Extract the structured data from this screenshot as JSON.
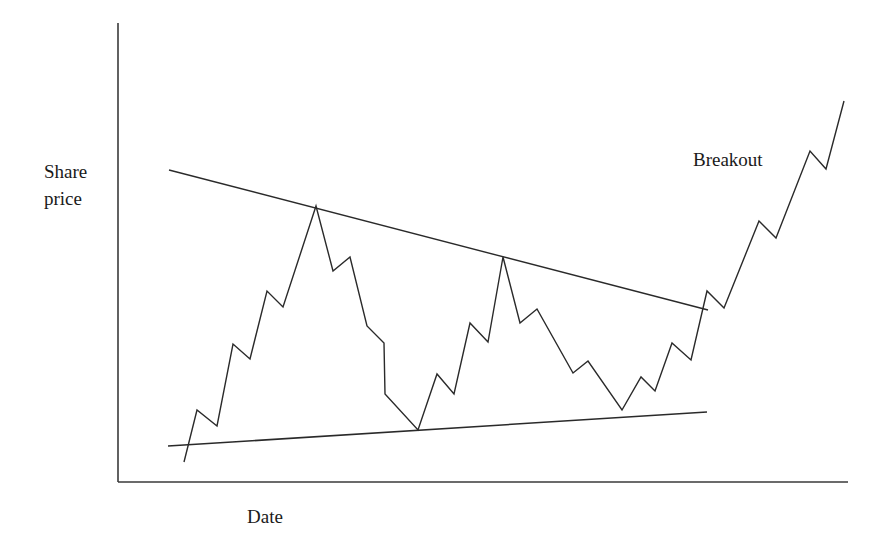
{
  "chart_data": {
    "type": "line",
    "title": "",
    "xlabel": "Date",
    "ylabel": "Share price",
    "ylabel_lines": [
      "Share",
      "price"
    ],
    "grid": false,
    "legend": null,
    "ticks": {
      "x": [],
      "y": []
    },
    "annotations": [
      {
        "text": "Breakout",
        "x_px": 693,
        "y_px": 160
      }
    ],
    "colors": {
      "line": "#2a2a2a",
      "axis": "#3a3a3a",
      "background": "#ffffff"
    },
    "axes_px": {
      "origin": [
        118,
        482
      ],
      "y_top": [
        118,
        23
      ],
      "x_end": [
        848,
        482
      ]
    },
    "series": [
      {
        "name": "Share price",
        "kind": "price",
        "points_px": [
          [
            184,
            462
          ],
          [
            197,
            410
          ],
          [
            217,
            426
          ],
          [
            233,
            344
          ],
          [
            250,
            359
          ],
          [
            267,
            291
          ],
          [
            283,
            307
          ],
          [
            316,
            206
          ],
          [
            333,
            271
          ],
          [
            350,
            257
          ],
          [
            367,
            326
          ],
          [
            384,
            343
          ],
          [
            385,
            394
          ],
          [
            418,
            430
          ],
          [
            437,
            374
          ],
          [
            454,
            394
          ],
          [
            470,
            323
          ],
          [
            488,
            342
          ],
          [
            503,
            257
          ],
          [
            520,
            323
          ],
          [
            537,
            309
          ],
          [
            573,
            373
          ],
          [
            588,
            361
          ],
          [
            622,
            410
          ],
          [
            641,
            377
          ],
          [
            655,
            391
          ],
          [
            672,
            343
          ],
          [
            691,
            360
          ],
          [
            707,
            291
          ],
          [
            724,
            308
          ],
          [
            759,
            221
          ],
          [
            776,
            238
          ],
          [
            810,
            151
          ],
          [
            826,
            169
          ],
          [
            844,
            101
          ]
        ]
      },
      {
        "name": "Upper trendline (resistance)",
        "kind": "trendline",
        "points_px": [
          [
            169,
            170
          ],
          [
            708,
            310
          ]
        ]
      },
      {
        "name": "Lower trendline (support)",
        "kind": "trendline",
        "points_px": [
          [
            168,
            446
          ],
          [
            707,
            412
          ]
        ]
      }
    ]
  }
}
